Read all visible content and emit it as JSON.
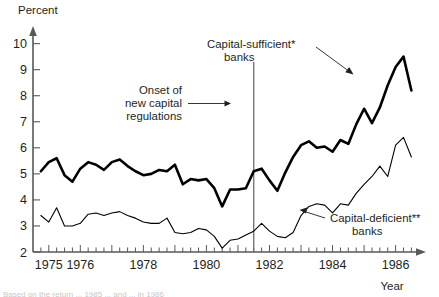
{
  "chart_data": {
    "type": "line",
    "title": "",
    "ylabel": "Percent",
    "xlabel": "Year",
    "ylim": [
      2,
      10.6
    ],
    "xlim": [
      1974.5,
      1986.9
    ],
    "yticks": [
      2,
      3,
      4,
      5,
      6,
      7,
      8,
      9,
      10
    ],
    "ytick_labels": [
      "2",
      "3",
      "4",
      "5",
      "6",
      "7",
      "8",
      "9",
      "10"
    ],
    "xticks": [
      1975,
      1976,
      1978,
      1980,
      1982,
      1984,
      1986
    ],
    "xtick_labels": [
      "1975",
      "1976",
      "1978",
      "1980",
      "1982",
      "1984",
      "1986"
    ],
    "grid": false,
    "legend_position": "inline-annotations",
    "series": [
      {
        "name": "Capital-sufficient* banks",
        "style": "thick",
        "x": [
          1974.75,
          1975.0,
          1975.25,
          1975.5,
          1975.75,
          1976.0,
          1976.25,
          1976.5,
          1976.75,
          1977.0,
          1977.25,
          1977.5,
          1977.75,
          1978.0,
          1978.25,
          1978.5,
          1978.75,
          1979.0,
          1979.25,
          1979.5,
          1979.75,
          1980.0,
          1980.25,
          1980.5,
          1980.75,
          1981.0,
          1981.25,
          1981.5,
          1981.75,
          1982.0,
          1982.25,
          1982.5,
          1982.75,
          1983.0,
          1983.25,
          1983.5,
          1983.75,
          1984.0,
          1984.25,
          1984.5,
          1984.75,
          1985.0,
          1985.25,
          1985.5,
          1985.75,
          1986.0,
          1986.25,
          1986.5
        ],
        "y": [
          5.1,
          5.45,
          5.6,
          4.95,
          4.7,
          5.2,
          5.45,
          5.35,
          5.15,
          5.45,
          5.55,
          5.3,
          5.1,
          4.95,
          5.0,
          5.15,
          5.1,
          5.35,
          4.6,
          4.8,
          4.75,
          4.8,
          4.45,
          3.75,
          4.4,
          4.4,
          4.45,
          5.1,
          5.2,
          4.75,
          4.35,
          5.05,
          5.65,
          6.1,
          6.25,
          6.0,
          6.05,
          5.85,
          6.3,
          6.15,
          6.9,
          7.5,
          6.95,
          7.55,
          8.4,
          9.1,
          9.5,
          8.2
        ]
      },
      {
        "name": "Capital-deficient** banks",
        "style": "thin",
        "x": [
          1974.75,
          1975.0,
          1975.25,
          1975.5,
          1975.75,
          1976.0,
          1976.25,
          1976.5,
          1976.75,
          1977.0,
          1977.25,
          1977.5,
          1977.75,
          1978.0,
          1978.25,
          1978.5,
          1978.75,
          1979.0,
          1979.25,
          1979.5,
          1979.75,
          1980.0,
          1980.25,
          1980.5,
          1980.75,
          1981.0,
          1981.25,
          1981.5,
          1981.75,
          1982.0,
          1982.25,
          1982.5,
          1982.75,
          1983.0,
          1983.25,
          1983.5,
          1983.75,
          1984.0,
          1984.25,
          1984.5,
          1984.75,
          1985.0,
          1985.25,
          1985.5,
          1985.75,
          1986.0,
          1986.25,
          1986.5
        ],
        "y": [
          3.4,
          3.15,
          3.7,
          3.0,
          3.0,
          3.1,
          3.45,
          3.5,
          3.4,
          3.5,
          3.55,
          3.4,
          3.3,
          3.15,
          3.1,
          3.1,
          3.3,
          2.75,
          2.7,
          2.75,
          2.9,
          2.85,
          2.6,
          2.15,
          2.45,
          2.5,
          2.65,
          2.8,
          3.1,
          2.8,
          2.6,
          2.55,
          2.75,
          3.4,
          3.75,
          3.85,
          3.8,
          3.5,
          3.85,
          3.8,
          4.25,
          4.6,
          4.9,
          5.3,
          4.9,
          6.1,
          6.4,
          5.65
        ]
      }
    ],
    "annotations": [
      {
        "id": "onset",
        "text_lines": [
          "Onset of",
          "new capital",
          "regulations"
        ],
        "points_to_year": 1981.5
      },
      {
        "id": "capital-sufficient",
        "text_lines": [
          "Capital-sufficient*",
          "banks"
        ]
      },
      {
        "id": "capital-deficient",
        "text_lines": [
          "Capital-deficient**",
          "banks"
        ]
      }
    ],
    "vertical_marker_year": 1981.5
  },
  "labels": {
    "y_axis_title": "Percent",
    "x_axis_title": "Year",
    "onset_line1": "Onset of",
    "onset_line2": "new capital",
    "onset_line3": "regulations",
    "sufficient_line1": "Capital-sufficient*",
    "sufficient_line2": "banks",
    "deficient_line1": "Capital-deficient**",
    "deficient_line2": "banks"
  },
  "footnote": {
    "text": "Based on the return ... 1985 ... and ... in 1986"
  },
  "colors": {
    "axis": "#58595b",
    "line": "#000000",
    "marker": "#6d6e71",
    "text": "#231f20"
  }
}
